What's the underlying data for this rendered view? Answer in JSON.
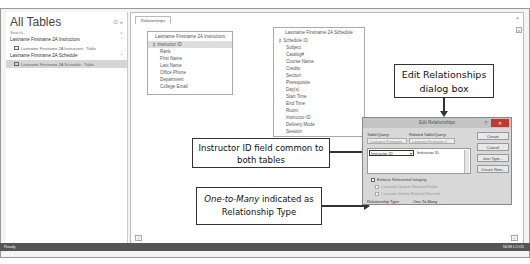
{
  "nav": {
    "title": "All Tables",
    "search_placeholder": "Search...",
    "groups": [
      {
        "label": "Lastname Firstname 2A Instructors",
        "items": [
          {
            "label": "Lastname Firstname 2A Instructors : Table",
            "selected": false
          }
        ]
      },
      {
        "label": "Lastname Firstname 2A Schedule",
        "items": [
          {
            "label": "Lastname Firstname 2A Schedule : Table",
            "selected": true
          }
        ]
      }
    ]
  },
  "workspace": {
    "tab_label": "Relationships",
    "tables": [
      {
        "title": "Lastname Firstname 2A Instructors",
        "fields": [
          "Instructor ID",
          "Rank",
          "First Name",
          "Last Name",
          "Office Phone",
          "Department",
          "College Email"
        ],
        "key_field_index": 0
      },
      {
        "title": "Lastname Firstname 2A Schedule",
        "fields": [
          "Schedule ID",
          "Subject",
          "Catalog#",
          "Course Name",
          "Credits",
          "Section",
          "Prerequisite",
          "Day(s)",
          "Start Time",
          "End Time",
          "Room",
          "Instructor ID",
          "Delivery Mode",
          "Session"
        ],
        "key_field_index": 0
      }
    ]
  },
  "dialog": {
    "title": "Edit Relationships",
    "help": "?",
    "close": "✕",
    "table_query_label": "Table/Query:",
    "related_label": "Related Table/Query:",
    "table_query_value": "Lastname Firstname...",
    "related_value": "Lastname Firstname 2...",
    "left_field": "Instructor ID",
    "right_field": "Instructor ID",
    "buttons": {
      "create": "Create",
      "cancel": "Cancel",
      "join_type": "Join Type...",
      "create_new": "Create New..."
    },
    "enforce": "Enforce Referential Integrity",
    "cascade_update": "Cascade Update Related Fields",
    "cascade_delete": "Cascade Delete Related Records",
    "relationship_type_label": "Relationship Type:",
    "relationship_type_value": "One-To-Many"
  },
  "callouts": {
    "edit_dialog": {
      "line1": "Edit Relationships",
      "line2": "dialog box"
    },
    "instructor_id": {
      "line1": "Instructor ID field common to",
      "line2": "both tables"
    },
    "one_to_many": {
      "italic": "One-to-Many",
      "rest": " indicated as",
      "line2": "Relationship Type"
    }
  },
  "status": {
    "left": "Ready",
    "right": "NUM LOCK"
  },
  "colors": {
    "close_button": "#c0392b",
    "status_bar": "#555555"
  }
}
